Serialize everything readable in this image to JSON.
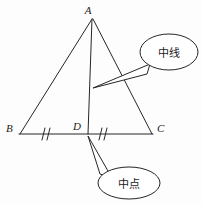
{
  "figure": {
    "background_color": "#fdfdfd",
    "stroke_color": "#262626",
    "triangle": {
      "vertices": [
        {
          "name": "A",
          "label": "A",
          "x": 92,
          "y": 18
        },
        {
          "name": "B",
          "label": "B",
          "x": 20,
          "y": 134
        },
        {
          "name": "C",
          "label": "C",
          "x": 152,
          "y": 134
        }
      ],
      "midpoint": {
        "name": "D",
        "label": "D",
        "x": 88,
        "y": 134
      },
      "median": {
        "from": "A",
        "to": "D"
      },
      "tick_marks": {
        "count_per_segment": 2,
        "segments": [
          "BD",
          "DC"
        ]
      }
    },
    "labels": {
      "apex": "A",
      "left": "B",
      "midpoint": "D",
      "right": "C"
    },
    "callouts": [
      {
        "name": "median-callout",
        "text": "中线",
        "meaning": "median",
        "center_x": 169,
        "center_y": 52,
        "rx": 29,
        "ry": 18,
        "points_to": "median-line-AD"
      },
      {
        "name": "midpoint-callout",
        "text": "中点",
        "meaning": "midpoint",
        "center_x": 129,
        "center_y": 183,
        "rx": 31,
        "ry": 16,
        "points_to": "point-D"
      }
    ]
  }
}
